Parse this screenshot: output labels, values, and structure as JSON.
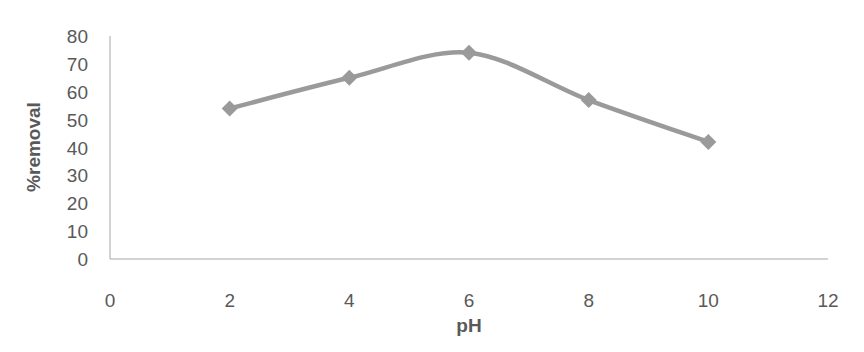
{
  "chart_data": {
    "type": "line",
    "title": "",
    "xlabel": "pH",
    "ylabel": "%removal",
    "x": [
      2,
      4,
      6,
      8,
      10
    ],
    "series": [
      {
        "name": "%removal",
        "values": [
          54,
          65,
          74,
          57,
          42
        ],
        "color": "#9a9a9a",
        "marker": "diamond",
        "smooth": true
      }
    ],
    "xlim": [
      0,
      12
    ],
    "ylim": [
      0,
      80
    ],
    "xticks": [
      "0",
      "2",
      "4",
      "6",
      "8",
      "10",
      "12"
    ],
    "yticks": [
      "0",
      "10",
      "20",
      "30",
      "40",
      "50",
      "60",
      "70",
      "80"
    ],
    "grid": false,
    "legend": "none"
  },
  "colors": {
    "line": "#9a9a9a",
    "axis": "#a6a6a6",
    "text": "#595959"
  }
}
